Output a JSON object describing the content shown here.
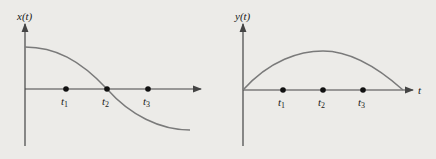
{
  "colors": {
    "background": "#ecebe8",
    "axis": "#444444",
    "curve": "#7a7a7a",
    "dot": "#111111"
  },
  "left_plot": {
    "ylabel": "x(t)",
    "ticks": [
      {
        "label": "t",
        "sub": "1"
      },
      {
        "label": "t",
        "sub": "2"
      },
      {
        "label": "t",
        "sub": "3"
      }
    ]
  },
  "right_plot": {
    "ylabel": "y(t)",
    "xlabel": "t",
    "ticks": [
      {
        "label": "t",
        "sub": "1"
      },
      {
        "label": "t",
        "sub": "2"
      },
      {
        "label": "t",
        "sub": "3"
      }
    ]
  }
}
